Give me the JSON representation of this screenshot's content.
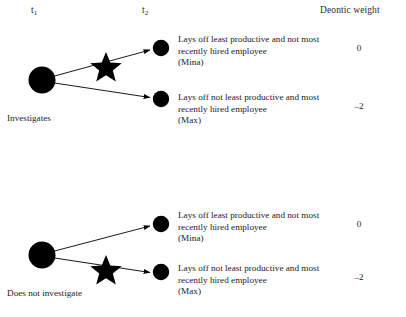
{
  "figure": {
    "headers": {
      "t1": "t",
      "t1_sub": "1",
      "t2": "t",
      "t2_sub": "2",
      "deontic_weight": "Deontic weight"
    },
    "trees": [
      {
        "root_label": "Investigates",
        "branches": [
          {
            "outcome": "Lays off least productive and not most recently hired employee\n(Mina)",
            "weight": "0",
            "starred": true
          },
          {
            "outcome": "Lays off not least productive and most recently hired employee\n(Max)",
            "weight": "–2",
            "starred": false
          }
        ]
      },
      {
        "root_label": "Does not investigate",
        "branches": [
          {
            "outcome": "Lays off least productive and not most recently hired employee\n(Mina)",
            "weight": "0",
            "starred": false
          },
          {
            "outcome": "Lays off not least productive and most recently hired employee\n(Max)",
            "weight": "–2",
            "starred": true
          }
        ]
      }
    ],
    "colors": {
      "node": "#000000",
      "edge": "#000000",
      "star": "#000000",
      "text": "#232323",
      "background": "#ffffff"
    }
  }
}
